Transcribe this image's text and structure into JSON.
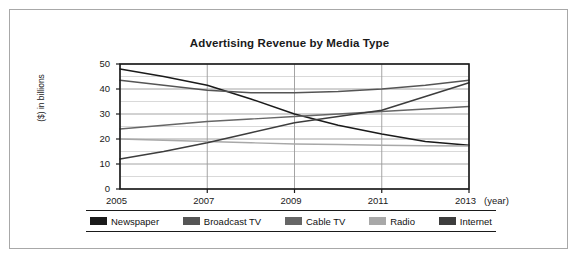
{
  "figure": {
    "title": "Advertising Revenue by Media Type",
    "x_unit_label": "(year)"
  },
  "chart_data": {
    "type": "line",
    "title": "Advertising Revenue by Media Type",
    "xlabel": "(year)",
    "ylabel": "($) in billions",
    "xlim": [
      2005,
      2013
    ],
    "ylim": [
      0,
      50
    ],
    "x": [
      2005,
      2006,
      2007,
      2008,
      2009,
      2010,
      2011,
      2012,
      2013
    ],
    "xticks": [
      2005,
      2007,
      2009,
      2011,
      2013
    ],
    "xtick_labels": [
      "2005",
      "2007",
      "2009",
      "2011",
      "2013"
    ],
    "yticks": [
      0,
      10,
      20,
      30,
      40,
      50
    ],
    "ytick_labels": [
      "0",
      "10",
      "20",
      "30",
      "40",
      "50"
    ],
    "y_minor_step": 5,
    "grid": "both",
    "legend_position": "bottom",
    "series": [
      {
        "name": "Newspaper",
        "color": "#1a1a1a",
        "values": [
          48,
          45,
          41.5,
          36,
          30,
          25.5,
          22,
          19,
          17.5
        ]
      },
      {
        "name": "Broadcast TV",
        "color": "#555555",
        "values": [
          43.5,
          41.5,
          39.5,
          38.5,
          38.5,
          39,
          40,
          41.5,
          43.5
        ]
      },
      {
        "name": "Cable TV",
        "color": "#666666",
        "values": [
          24,
          25.5,
          27,
          28,
          29,
          30,
          31,
          32,
          33
        ]
      },
      {
        "name": "Radio",
        "color": "#a8a8a8",
        "values": [
          20,
          19.5,
          19,
          18.5,
          18,
          17.8,
          17.5,
          17.3,
          17.2
        ]
      },
      {
        "name": "Internet",
        "color": "#3d3d3d",
        "values": [
          12,
          15,
          18.5,
          22.5,
          26.5,
          29,
          31.5,
          37,
          42.5
        ]
      }
    ]
  },
  "legend": {
    "items": [
      {
        "label": "Newspaper",
        "color": "#1a1a1a"
      },
      {
        "label": "Broadcast TV",
        "color": "#555555"
      },
      {
        "label": "Cable TV",
        "color": "#666666"
      },
      {
        "label": "Radio",
        "color": "#a8a8a8"
      },
      {
        "label": "Internet",
        "color": "#3d3d3d"
      }
    ]
  },
  "colors": {
    "frame": "#a8a8a8",
    "axis": "#1a1a1a",
    "grid_major": "#9a9a9a",
    "grid_minor": "#c9c9c9",
    "background": "#ffffff"
  }
}
